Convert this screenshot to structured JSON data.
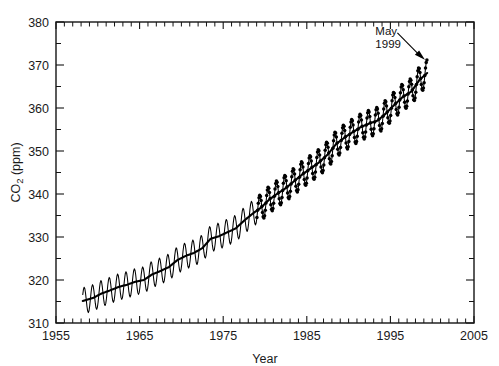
{
  "chart_data": {
    "type": "line",
    "title": "",
    "subtitle": "",
    "xlabel": "Year",
    "ylabel": "CO2 (ppm)",
    "ylabel_base": "CO",
    "ylabel_sub": "2",
    "ylabel_unit": " (ppm)",
    "xlim": [
      1955,
      2005
    ],
    "ylim": [
      310,
      380
    ],
    "x_major_ticks": [
      1955,
      1965,
      1975,
      1985,
      1995,
      2005
    ],
    "x_major_tick_labels": [
      "1955",
      "1965",
      "1975",
      "1985",
      "1995",
      "2005"
    ],
    "x_minor_tick_step": 1,
    "y_major_ticks": [
      310,
      320,
      330,
      340,
      350,
      360,
      370,
      380
    ],
    "y_major_tick_labels": [
      "310",
      "320",
      "330",
      "340",
      "350",
      "360",
      "370",
      "380"
    ],
    "y_minor_ticks": [
      315,
      325,
      335,
      345,
      355,
      365,
      375
    ],
    "grid": false,
    "legend": null,
    "legend_position": "none",
    "line_color": "#000000",
    "trend_color": "#000000",
    "background_color": "#ffffff",
    "axis_color": "#141414",
    "annotations": [
      {
        "name": "may-1999-callout",
        "text_line1": "May",
        "text_line2": "1999",
        "points_to_x": 1999.37,
        "points_to_y": 371.0,
        "label_x": 1993.2,
        "label_y": 377.0
      }
    ],
    "series": [
      {
        "name": "Monthly mean CO2 (Mauna Loa)",
        "style": "sawtooth-monthly",
        "seasonal_amplitude_ppm": 3.1,
        "seasonal_peak_month": 5,
        "seasonal_trough_month": 10,
        "marker_start_year": 1979,
        "x_start": 1958.2,
        "x_end": 1999.4,
        "annual_means": [
          {
            "year": 1958,
            "value": 315.3
          },
          {
            "year": 1959,
            "value": 315.9
          },
          {
            "year": 1960,
            "value": 316.9
          },
          {
            "year": 1961,
            "value": 317.6
          },
          {
            "year": 1962,
            "value": 318.4
          },
          {
            "year": 1963,
            "value": 318.9
          },
          {
            "year": 1964,
            "value": 319.6
          },
          {
            "year": 1965,
            "value": 320.0
          },
          {
            "year": 1966,
            "value": 321.3
          },
          {
            "year": 1967,
            "value": 322.1
          },
          {
            "year": 1968,
            "value": 323.0
          },
          {
            "year": 1969,
            "value": 324.6
          },
          {
            "year": 1970,
            "value": 325.6
          },
          {
            "year": 1971,
            "value": 326.3
          },
          {
            "year": 1972,
            "value": 327.4
          },
          {
            "year": 1973,
            "value": 329.6
          },
          {
            "year": 1974,
            "value": 330.2
          },
          {
            "year": 1975,
            "value": 331.1
          },
          {
            "year": 1976,
            "value": 332.0
          },
          {
            "year": 1977,
            "value": 333.8
          },
          {
            "year": 1978,
            "value": 335.4
          },
          {
            "year": 1979,
            "value": 336.8
          },
          {
            "year": 1980,
            "value": 338.7
          },
          {
            "year": 1981,
            "value": 340.1
          },
          {
            "year": 1982,
            "value": 341.4
          },
          {
            "year": 1983,
            "value": 343.0
          },
          {
            "year": 1984,
            "value": 344.6
          },
          {
            "year": 1985,
            "value": 346.0
          },
          {
            "year": 1986,
            "value": 347.4
          },
          {
            "year": 1987,
            "value": 349.2
          },
          {
            "year": 1988,
            "value": 351.6
          },
          {
            "year": 1989,
            "value": 353.1
          },
          {
            "year": 1990,
            "value": 354.4
          },
          {
            "year": 1991,
            "value": 355.6
          },
          {
            "year": 1992,
            "value": 356.4
          },
          {
            "year": 1993,
            "value": 357.1
          },
          {
            "year": 1994,
            "value": 358.8
          },
          {
            "year": 1995,
            "value": 360.8
          },
          {
            "year": 1996,
            "value": 362.6
          },
          {
            "year": 1997,
            "value": 363.8
          },
          {
            "year": 1998,
            "value": 366.6
          },
          {
            "year": 1999,
            "value": 368.3
          }
        ]
      }
    ]
  }
}
